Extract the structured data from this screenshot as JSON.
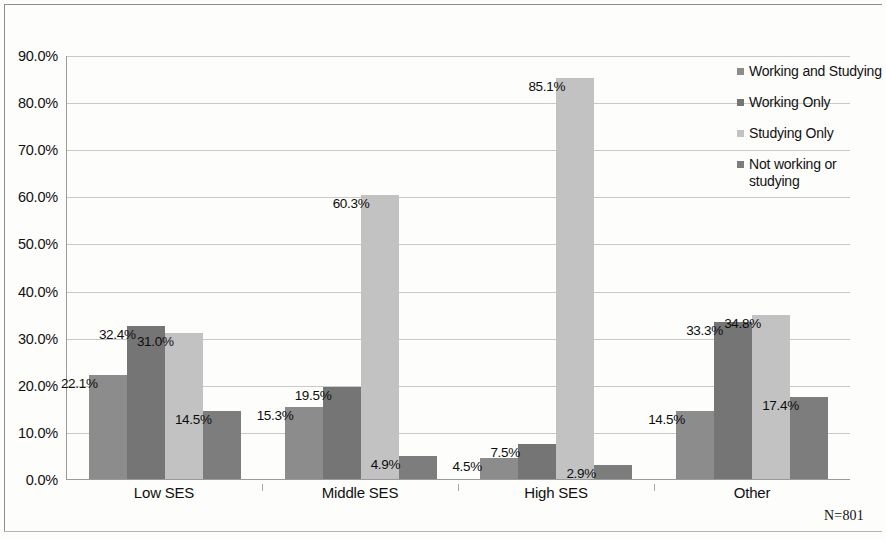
{
  "chart_data": {
    "type": "bar",
    "title": "",
    "xlabel": "",
    "ylabel": "",
    "categories": [
      "Low SES",
      "Middle SES",
      "High SES",
      "Other"
    ],
    "series": [
      {
        "name": "Working and Studying",
        "color": "#8c8c8c",
        "values": [
          22.1,
          15.3,
          4.5,
          14.5
        ],
        "labels": [
          "22.1%",
          "15.3%",
          "4.5%",
          "14.5%"
        ]
      },
      {
        "name": "Working Only",
        "color": "#757575",
        "values": [
          32.4,
          19.5,
          7.5,
          33.3
        ],
        "labels": [
          "32.4%",
          "19.5%",
          "7.5%",
          "33.3%"
        ]
      },
      {
        "name": "Studying Only",
        "color": "#c2c2c2",
        "values": [
          31.0,
          60.3,
          85.1,
          34.8
        ],
        "labels": [
          "31.0%",
          "60.3%",
          "85.1%",
          "34.8%"
        ]
      },
      {
        "name": "Not working or studying",
        "color": "#7d7d7d",
        "values": [
          14.5,
          4.9,
          2.9,
          17.4
        ],
        "labels": [
          "14.5%",
          "4.9%",
          "2.9%",
          "17.4%"
        ]
      }
    ],
    "ylim": [
      0,
      90
    ],
    "ytick_values": [
      0,
      10,
      20,
      30,
      40,
      50,
      60,
      70,
      80,
      90
    ],
    "ytick_labels": [
      "0.0%",
      "10.0%",
      "20.0%",
      "30.0%",
      "40.0%",
      "50.0%",
      "60.0%",
      "70.0%",
      "80.0%",
      "90.0%"
    ],
    "grid": true,
    "legend_position": "right",
    "annotations": [
      "N=801"
    ]
  },
  "footnote": {
    "sample_size": "N=801"
  }
}
